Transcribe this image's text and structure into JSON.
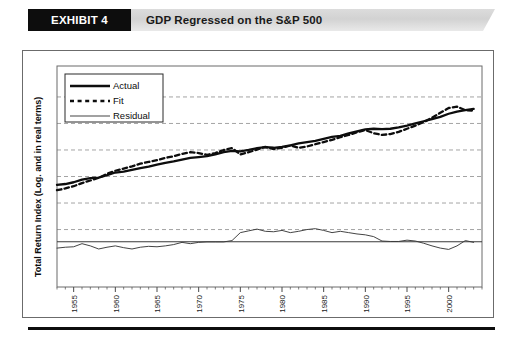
{
  "header": {
    "tag_label": "EXHIBIT 4",
    "title": "GDP Regressed on the S&P 500",
    "tag_bg": "#0d0d0d",
    "tag_fg": "#ffffff",
    "banner_bg_start": "#d4d4d4",
    "banner_bg_end": "#ebebeb"
  },
  "chart_data": {
    "type": "line",
    "title": "GDP Regressed on the S&P 500",
    "xlabel": "",
    "ylabel": "Total Return Index (Log. and in real terms)",
    "grid": true,
    "legend_position": "top-left",
    "xlim": [
      1953,
      2004
    ],
    "ylim": [
      0,
      10
    ],
    "xticks": [
      "1955",
      "1960",
      "1965",
      "1970",
      "1975",
      "1980",
      "1985",
      "1990",
      "1995",
      "2000"
    ],
    "xtick_values": [
      1955,
      1960,
      1965,
      1970,
      1975,
      1980,
      1985,
      1990,
      1995,
      2000
    ],
    "yticks": [],
    "gridline_values": [
      8.6,
      7.4,
      6.2,
      5.0,
      3.8,
      2.6
    ],
    "zero_reference_value": 2.05,
    "legend": [
      {
        "label": "Actual",
        "style": "solid-thick",
        "color": "#0d0d0d"
      },
      {
        "label": "Fit",
        "style": "dashed",
        "color": "#0d0d0d"
      },
      {
        "label": "Residual",
        "style": "solid-thin",
        "color": "#4a4a4a"
      }
    ],
    "x": [
      1953,
      1954,
      1955,
      1956,
      1957,
      1958,
      1959,
      1960,
      1961,
      1962,
      1963,
      1964,
      1965,
      1966,
      1967,
      1968,
      1969,
      1970,
      1971,
      1972,
      1973,
      1974,
      1975,
      1976,
      1977,
      1978,
      1979,
      1980,
      1981,
      1982,
      1983,
      1984,
      1985,
      1986,
      1987,
      1988,
      1989,
      1990,
      1991,
      1992,
      1993,
      1994,
      1995,
      1996,
      1997,
      1998,
      1999,
      2000,
      2001,
      2002,
      2003
    ],
    "series": [
      {
        "name": "Actual",
        "style": "solid-thick",
        "values": [
          4.62,
          4.66,
          4.74,
          4.86,
          4.93,
          4.95,
          5.06,
          5.18,
          5.22,
          5.3,
          5.38,
          5.45,
          5.54,
          5.62,
          5.68,
          5.76,
          5.84,
          5.88,
          5.92,
          6.0,
          6.1,
          6.16,
          6.14,
          6.2,
          6.28,
          6.33,
          6.3,
          6.34,
          6.41,
          6.5,
          6.56,
          6.61,
          6.7,
          6.79,
          6.84,
          6.95,
          7.04,
          7.13,
          7.16,
          7.14,
          7.16,
          7.22,
          7.3,
          7.4,
          7.5,
          7.6,
          7.7,
          7.84,
          7.94,
          8.0,
          8.06
        ]
      },
      {
        "name": "Fit",
        "style": "dashed",
        "values": [
          4.38,
          4.46,
          4.56,
          4.7,
          4.82,
          4.94,
          5.12,
          5.26,
          5.36,
          5.46,
          5.58,
          5.66,
          5.74,
          5.84,
          5.92,
          6.02,
          6.1,
          6.06,
          5.98,
          6.06,
          6.2,
          6.28,
          6.0,
          6.1,
          6.22,
          6.34,
          6.24,
          6.3,
          6.4,
          6.3,
          6.36,
          6.46,
          6.56,
          6.66,
          6.78,
          6.88,
          7.0,
          7.1,
          6.96,
          6.88,
          6.92,
          7.02,
          7.16,
          7.3,
          7.46,
          7.66,
          7.88,
          8.1,
          8.16,
          8.0,
          7.98
        ]
      },
      {
        "name": "Residual",
        "style": "solid-thin",
        "values": [
          1.76,
          1.8,
          1.82,
          1.96,
          1.86,
          1.72,
          1.8,
          1.86,
          1.78,
          1.72,
          1.8,
          1.84,
          1.82,
          1.86,
          1.92,
          2.02,
          1.96,
          2.02,
          2.04,
          2.04,
          2.04,
          2.1,
          2.46,
          2.54,
          2.62,
          2.52,
          2.5,
          2.56,
          2.46,
          2.52,
          2.6,
          2.64,
          2.56,
          2.46,
          2.52,
          2.46,
          2.4,
          2.36,
          2.28,
          2.08,
          2.06,
          2.06,
          2.12,
          2.08,
          1.98,
          1.86,
          1.76,
          1.7,
          1.86,
          2.1,
          2.02
        ]
      }
    ]
  }
}
